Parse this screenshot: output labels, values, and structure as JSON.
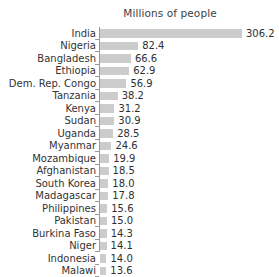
{
  "chart_data": {
    "type": "bar",
    "orientation": "horizontal",
    "title": "Millions of people",
    "xlabel": "",
    "ylabel": "",
    "grid": false,
    "legend": false,
    "value_labels": true,
    "xlim": [
      0,
      306.2
    ],
    "categories": [
      "India",
      "Nigeria",
      "Bangladesh",
      "Ethiopia",
      "Dem. Rep. Congo",
      "Tanzania",
      "Kenya",
      "Sudan",
      "Uganda",
      "Myanmar",
      "Mozambique",
      "Afghanistan",
      "South Korea",
      "Madagascar",
      "Philippines",
      "Pakistan",
      "Burkina Faso",
      "Niger",
      "Indonesia",
      "Malawi"
    ],
    "values": [
      306.2,
      82.4,
      66.6,
      62.9,
      56.9,
      38.2,
      31.2,
      30.9,
      28.5,
      24.6,
      19.9,
      18.5,
      18.0,
      17.8,
      15.6,
      15.0,
      14.3,
      14.1,
      14.0,
      13.6
    ],
    "value_texts": [
      "306.2",
      "82.4",
      "66.6",
      "62.9",
      "56.9",
      "38.2",
      "31.2",
      "30.9",
      "28.5",
      "24.6",
      "19.9",
      "18.5",
      "18.0",
      "17.8",
      "15.6",
      "15.0",
      "14.3",
      "14.1",
      "14.0",
      "13.6"
    ],
    "colors": {
      "bar": "#cccccc",
      "axis": "#9a9a9a",
      "label_text": "#333333",
      "value_text": "#2f2f2f",
      "title_text": "#3f3f3f",
      "background": "#ffffff"
    }
  }
}
